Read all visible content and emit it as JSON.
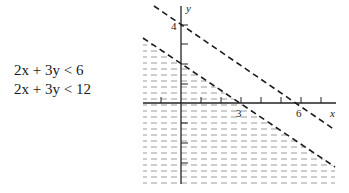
{
  "equations": [
    {
      "text": "2x + 3y < 6"
    },
    {
      "text": "2x + 3y < 12"
    }
  ],
  "graph": {
    "x_axis_label": "x",
    "y_axis_label": "y",
    "x_tick_labels": [
      {
        "value": 3,
        "text": "3"
      },
      {
        "value": 6,
        "text": "6"
      }
    ],
    "y_tick_labels": [
      {
        "value": 4,
        "text": "4"
      }
    ],
    "lines": [
      {
        "name": "2x + 3y = 6",
        "style": "dashed",
        "x_intercept": 3,
        "y_intercept": 2
      },
      {
        "name": "2x + 3y = 12",
        "style": "dashed",
        "x_intercept": 6,
        "y_intercept": 4
      }
    ],
    "shaded_region": "2x + 3y < 6",
    "colors": {
      "line": "#1a1a1a",
      "shading": "#9a9a9a"
    }
  }
}
